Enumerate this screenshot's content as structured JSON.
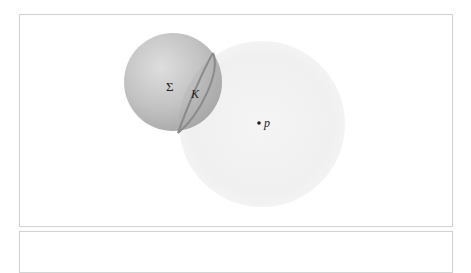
{
  "figure": {
    "labels": {
      "sphere": "Σ",
      "circle": "K",
      "point": "p"
    },
    "colors": {
      "sphere_fill": "#b3b3b3",
      "sphere_highlight": "#dcdcdc",
      "disc_fill": "#f2f2f2",
      "circle_stroke": "#8a8a8a",
      "frame_border": "#d4d4d4"
    }
  }
}
